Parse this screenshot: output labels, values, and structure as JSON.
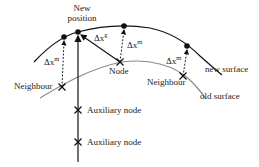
{
  "diagram": {
    "labels": {
      "new_position_line1": "New",
      "new_position_line2": "position",
      "neighbour_left": "Neighbour",
      "node": "Node",
      "neighbour_right": "Neighbour",
      "new_surface": "new surface",
      "old_surface": "old surface",
      "auxiliary_node_1": "Auxiliary node",
      "auxiliary_node_2": "Auxiliary node"
    },
    "displacements": {
      "left_m": {
        "base": "Δx",
        "sup": "m"
      },
      "global_g": {
        "base": "Δx",
        "sup": "g"
      },
      "node_m": {
        "base": "Δx",
        "sup": "m"
      },
      "right_m": {
        "base": "Δx",
        "sup": "m"
      }
    },
    "colors": {
      "new_surface": "#111111",
      "old_surface": "#8a8a8a",
      "ink": "#222222"
    }
  }
}
